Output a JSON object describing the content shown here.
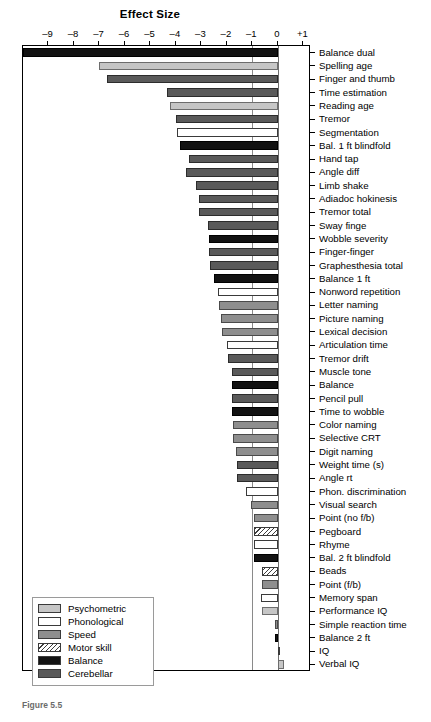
{
  "chart_data": {
    "type": "bar",
    "orientation": "horizontal",
    "title": "Effect Size",
    "xlabel": "Effect Size",
    "ylabel": "",
    "xlim": [
      -10,
      1.3
    ],
    "xticks": [
      -9,
      -8,
      -7,
      -6,
      -5,
      -4,
      -3,
      -2,
      -1,
      0,
      1
    ],
    "xticklabels": [
      "–9",
      "–8",
      "–7",
      "–6",
      "–5",
      "–4",
      "–3",
      "–2",
      "–1",
      "0",
      "+1"
    ],
    "grid": false,
    "reference_lines": [
      0,
      -1
    ],
    "legend_position": "bottom-left",
    "categories": [
      "Balance dual",
      "Spelling age",
      "Finger and thumb",
      "Time estimation",
      "Reading age",
      "Tremor",
      "Segmentation",
      "Bal. 1 ft blindfold",
      "Hand tap",
      "Angle diff",
      "Limb shake",
      "Adiadoc hokinesis",
      "Tremor total",
      "Sway finge",
      "Wobble severity",
      "Finger-finger",
      "Graphesthesia total",
      "Balance 1 ft",
      "Nonword repetition",
      "Letter naming",
      "Picture naming",
      "Lexical decision",
      "Articulation time",
      "Tremor drift",
      "Muscle tone",
      "Balance",
      "Pencil pull",
      "Time to wobble",
      "Color naming",
      "Selective CRT",
      "Digit naming",
      "Weight time (s)",
      "Angle rt",
      "Phon. discrimination",
      "Visual search",
      "Point (no f/b)",
      "Pegboard",
      "Rhyme",
      "Bal. 2 ft blindfold",
      "Beads",
      "Point (f/b)",
      "Memory span",
      "Performance IQ",
      "Simple reaction time",
      "Balance 2 ft",
      "IQ",
      "Verbal IQ"
    ],
    "values": [
      -10.0,
      -7.0,
      -6.7,
      -4.35,
      -4.25,
      -4.0,
      -3.95,
      -3.85,
      -3.5,
      -3.6,
      -3.2,
      -3.1,
      -3.1,
      -2.75,
      -2.7,
      -2.7,
      -2.65,
      -2.5,
      -2.35,
      -2.3,
      -2.25,
      -2.2,
      -2.0,
      -1.95,
      -1.8,
      -1.8,
      -1.8,
      -1.8,
      -1.75,
      -1.75,
      -1.65,
      -1.6,
      -1.6,
      -1.25,
      -1.05,
      -0.95,
      -0.95,
      -0.95,
      -0.95,
      -0.62,
      -0.62,
      -0.66,
      -0.62,
      -0.12,
      -0.12,
      0.1,
      0.25
    ],
    "series_groups": [
      "balance",
      "psychometric",
      "cerebellar",
      "cerebellar",
      "psychometric",
      "cerebellar",
      "phonological",
      "balance",
      "cerebellar",
      "cerebellar",
      "cerebellar",
      "cerebellar",
      "cerebellar",
      "cerebellar",
      "balance",
      "cerebellar",
      "cerebellar",
      "balance",
      "phonological",
      "speed",
      "speed",
      "speed",
      "phonological",
      "cerebellar",
      "cerebellar",
      "balance",
      "cerebellar",
      "balance",
      "speed",
      "speed",
      "speed",
      "cerebellar",
      "cerebellar",
      "phonological",
      "speed",
      "speed",
      "motorskill",
      "phonological",
      "balance",
      "motorskill",
      "speed",
      "phonological",
      "psychometric",
      "speed",
      "balance",
      "phonological",
      "psychometric"
    ]
  },
  "legend": {
    "items": [
      {
        "label": "Psychometric",
        "key": "psychometric",
        "color": "#c6c6c6"
      },
      {
        "label": "Phonological",
        "key": "phonological",
        "color": "#ffffff"
      },
      {
        "label": "Speed",
        "key": "speed",
        "color": "#8e8e8e"
      },
      {
        "label": "Motor skill",
        "key": "motorskill",
        "color": "#ffffff"
      },
      {
        "label": "Balance",
        "key": "balance",
        "color": "#121212"
      },
      {
        "label": "Cerebellar",
        "key": "cerebellar",
        "color": "#5a5a5a"
      }
    ]
  },
  "caption": "Figure 5.5"
}
